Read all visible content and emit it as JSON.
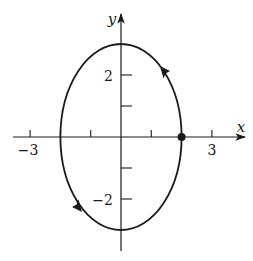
{
  "figure": {
    "type": "parametric-curve-plot",
    "axes": {
      "x_label": "x",
      "y_label": "y",
      "x_tick_values": [
        -3,
        -2,
        -1,
        1,
        2,
        3
      ],
      "y_tick_values": [
        -2,
        -1,
        1,
        2
      ],
      "x_tick_labels": [
        {
          "value": -3,
          "text": "−3"
        },
        {
          "value": 3,
          "text": "3"
        }
      ],
      "y_tick_labels": [
        {
          "value": 2,
          "text": "2"
        },
        {
          "value": -2,
          "text": "−2"
        }
      ]
    },
    "curve": {
      "shape": "ellipse",
      "equation": "x^2/4 + y^2/9 = 1",
      "center": [
        0,
        0
      ],
      "semi_axis_x": 2,
      "semi_axis_y": 3,
      "direction": "counterclockwise",
      "start_point": [
        2,
        0
      ],
      "arrow_positions": [
        "upper-right arc",
        "lower-left arc"
      ]
    },
    "colors": {
      "stroke": "#1a1a1a",
      "background": "#ffffff"
    }
  },
  "labels": {
    "x_axis": "x",
    "y_axis": "y",
    "x_neg3": "−3",
    "x_pos3": "3",
    "y_pos2": "2",
    "y_neg2": "−2"
  }
}
